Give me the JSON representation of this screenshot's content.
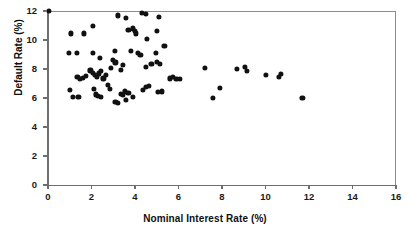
{
  "chart_data": {
    "type": "scatter",
    "title": "",
    "xlabel": "Nominal Interest Rate (%)",
    "ylabel": "Default Rate (%)",
    "xlim": [
      0,
      16
    ],
    "ylim": [
      0,
      12
    ],
    "xticks": [
      0,
      2,
      4,
      6,
      8,
      10,
      12,
      14,
      16
    ],
    "yticks": [
      0,
      2,
      4,
      6,
      8,
      10,
      12
    ],
    "xtick_labels": [
      "0",
      "2",
      "4",
      "6",
      "8",
      "10",
      "12",
      "14",
      "16"
    ],
    "ytick_labels": [
      "0",
      "2",
      "4",
      "6",
      "8",
      "10",
      "12"
    ],
    "grid": false,
    "legend": null,
    "marker": "filled-circle",
    "marker_color": "#111111",
    "points": [
      [
        0.05,
        12.0
      ],
      [
        1.06,
        10.45
      ],
      [
        1.65,
        10.45
      ],
      [
        2.07,
        11.0
      ],
      [
        0.97,
        9.1
      ],
      [
        1.33,
        9.1
      ],
      [
        2.07,
        9.1
      ],
      [
        3.08,
        9.25
      ],
      [
        3.2,
        11.7
      ],
      [
        3.6,
        11.55
      ],
      [
        4.3,
        11.85
      ],
      [
        4.5,
        11.8
      ],
      [
        5.1,
        11.6
      ],
      [
        3.7,
        10.7
      ],
      [
        3.9,
        10.8
      ],
      [
        4.0,
        10.6
      ],
      [
        4.05,
        10.45
      ],
      [
        5.0,
        10.6
      ],
      [
        4.55,
        10.05
      ],
      [
        5.35,
        9.6
      ],
      [
        3.8,
        9.25
      ],
      [
        4.15,
        9.1
      ],
      [
        4.25,
        8.95
      ],
      [
        4.95,
        9.1
      ],
      [
        2.4,
        8.75
      ],
      [
        3.0,
        8.6
      ],
      [
        3.1,
        8.45
      ],
      [
        3.45,
        8.3
      ],
      [
        1.35,
        7.45
      ],
      [
        1.45,
        7.3
      ],
      [
        1.6,
        7.4
      ],
      [
        1.75,
        7.55
      ],
      [
        1.95,
        7.9
      ],
      [
        2.05,
        7.75
      ],
      [
        2.15,
        7.6
      ],
      [
        2.25,
        7.45
      ],
      [
        2.35,
        7.7
      ],
      [
        2.45,
        7.85
      ],
      [
        2.55,
        7.35
      ],
      [
        2.65,
        7.6
      ],
      [
        2.9,
        8.05
      ],
      [
        3.35,
        7.95
      ],
      [
        4.5,
        8.15
      ],
      [
        4.75,
        8.35
      ],
      [
        5.0,
        8.5
      ],
      [
        5.15,
        8.35
      ],
      [
        1.0,
        6.55
      ],
      [
        1.15,
        6.1
      ],
      [
        1.4,
        6.05
      ],
      [
        2.1,
        6.6
      ],
      [
        2.2,
        6.25
      ],
      [
        2.3,
        6.15
      ],
      [
        2.45,
        6.1
      ],
      [
        2.75,
        6.9
      ],
      [
        2.85,
        6.6
      ],
      [
        3.1,
        5.75
      ],
      [
        3.2,
        5.65
      ],
      [
        3.35,
        6.3
      ],
      [
        3.45,
        6.2
      ],
      [
        3.55,
        6.45
      ],
      [
        3.7,
        6.35
      ],
      [
        3.6,
        5.85
      ],
      [
        3.9,
        6.05
      ],
      [
        4.35,
        6.55
      ],
      [
        4.5,
        6.75
      ],
      [
        4.65,
        6.85
      ],
      [
        5.05,
        6.4
      ],
      [
        5.25,
        6.45
      ],
      [
        5.6,
        7.35
      ],
      [
        5.75,
        7.45
      ],
      [
        5.9,
        7.3
      ],
      [
        6.05,
        7.3
      ],
      [
        7.2,
        8.1
      ],
      [
        7.6,
        6.0
      ],
      [
        7.9,
        6.7
      ],
      [
        8.7,
        8.0
      ],
      [
        9.05,
        8.15
      ],
      [
        9.15,
        7.85
      ],
      [
        10.0,
        7.6
      ],
      [
        10.6,
        7.45
      ],
      [
        10.7,
        7.65
      ],
      [
        11.7,
        6.0
      ]
    ]
  }
}
